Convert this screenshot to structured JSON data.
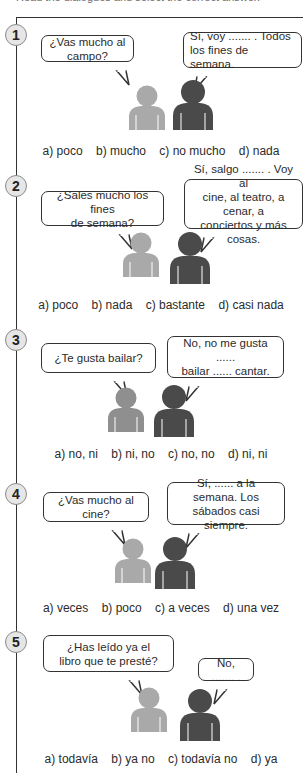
{
  "instruction": "Read the dialogues and select the correct answer.",
  "colors": {
    "frame": "#333333",
    "person_light": "#a9a9a9",
    "person_dark": "#4a4a4a",
    "badge_fill": "#e6e6e6",
    "badge_border": "#8a8a8a"
  },
  "exercises": [
    {
      "number": "1",
      "question": "¿Vas mucho al campo?",
      "answer": "Sí, voy ....... . Todos\nlos fines de semana.",
      "options": [
        "a) poco",
        "b) mucho",
        "c) no mucho",
        "d) nada"
      ]
    },
    {
      "number": "2",
      "question": "¿Sales mucho los fines\nde semana?",
      "answer": "Sí, salgo ....... . Voy al\ncine, al teatro, a cenar, a\nconciertos y más cosas.",
      "options": [
        "a) poco",
        "b) nada",
        "c) bastante",
        "d) casi nada"
      ]
    },
    {
      "number": "3",
      "question": "¿Te gusta bailar?",
      "answer": "No, no me gusta ......\nbailar ...... cantar.",
      "options": [
        "a) no, ni",
        "b) ni, no",
        "c) no, no",
        "d) ni, ni"
      ]
    },
    {
      "number": "4",
      "question": "¿Vas mucho al cine?",
      "answer": "Sí, ...... a la semana. Los\nsábados casi siempre.",
      "options": [
        "a) veces",
        "b) poco",
        "c) a veces",
        "d) una vez"
      ]
    },
    {
      "number": "5",
      "question": "¿Has leído ya el\nlibro que te presté?",
      "answer": "No, ....... .",
      "options": [
        "a) todavía",
        "b) ya no",
        "c) todavía no",
        "d) ya"
      ]
    }
  ]
}
